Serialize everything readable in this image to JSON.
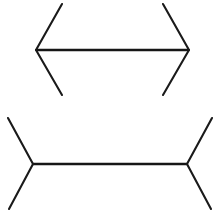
{
  "figure": {
    "name": "Muller-Lyer illusion",
    "background_color": "#ffffff",
    "line_color": "#1a1a1a",
    "stroke_width": 2.1,
    "canvas": {
      "width": 223,
      "height": 213
    },
    "shapes": [
      {
        "id": "top-figure",
        "label": "arrowheads-inward",
        "shaft": {
          "x1": 36,
          "y1": 50,
          "x2": 189,
          "y2": 50,
          "length_px": 153
        },
        "fins": [
          {
            "id": "top-left-upper-fin",
            "x1": 36,
            "y1": 50,
            "x2": 62,
            "y2": 4
          },
          {
            "id": "top-left-lower-fin",
            "x1": 36,
            "y1": 50,
            "x2": 62,
            "y2": 95
          },
          {
            "id": "top-right-upper-fin",
            "x1": 189,
            "y1": 50,
            "x2": 163,
            "y2": 4
          },
          {
            "id": "top-right-lower-fin",
            "x1": 189,
            "y1": 50,
            "x2": 163,
            "y2": 95
          }
        ]
      },
      {
        "id": "bottom-figure",
        "label": "arrowheads-outward",
        "shaft": {
          "x1": 33,
          "y1": 164,
          "x2": 187,
          "y2": 164,
          "length_px": 154
        },
        "fins": [
          {
            "id": "bottom-left-upper-fin",
            "x1": 33,
            "y1": 164,
            "x2": 8,
            "y2": 118
          },
          {
            "id": "bottom-left-lower-fin",
            "x1": 33,
            "y1": 164,
            "x2": 9,
            "y2": 209
          },
          {
            "id": "bottom-right-upper-fin",
            "x1": 187,
            "y1": 164,
            "x2": 212,
            "y2": 118
          },
          {
            "id": "bottom-right-lower-fin",
            "x1": 187,
            "y1": 164,
            "x2": 211,
            "y2": 209
          }
        ]
      }
    ]
  }
}
